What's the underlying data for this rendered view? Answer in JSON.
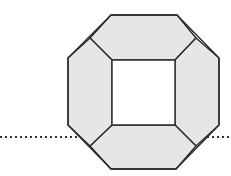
{
  "diagram": {
    "type": "octagonal-frame",
    "colors": {
      "fill": "#e6e6e6",
      "stroke": "#2b2b2b",
      "inner": "#ffffff",
      "dotted": "#333333"
    },
    "outer_octagon": [
      [
        111,
        15
      ],
      [
        177,
        15
      ],
      [
        219,
        58
      ],
      [
        219,
        125
      ],
      [
        176,
        169
      ],
      [
        111,
        169
      ],
      [
        68,
        125
      ],
      [
        68,
        58
      ]
    ],
    "inner_square": [
      [
        112,
        60
      ],
      [
        175,
        60
      ],
      [
        175,
        125
      ],
      [
        112,
        125
      ]
    ],
    "panels": [
      {
        "name": "top-panel",
        "points": [
          [
            111,
            15
          ],
          [
            177,
            15
          ],
          [
            196,
            38
          ],
          [
            175,
            60
          ],
          [
            112,
            60
          ],
          [
            90,
            38
          ]
        ]
      },
      {
        "name": "right-panel",
        "points": [
          [
            196,
            38
          ],
          [
            219,
            58
          ],
          [
            219,
            125
          ],
          [
            196,
            146
          ],
          [
            175,
            125
          ],
          [
            175,
            60
          ]
        ]
      },
      {
        "name": "bottom-panel",
        "points": [
          [
            112,
            125
          ],
          [
            175,
            125
          ],
          [
            196,
            146
          ],
          [
            176,
            169
          ],
          [
            111,
            169
          ],
          [
            90,
            146
          ]
        ]
      },
      {
        "name": "left-panel",
        "points": [
          [
            90,
            38
          ],
          [
            112,
            60
          ],
          [
            112,
            125
          ],
          [
            90,
            146
          ],
          [
            68,
            125
          ],
          [
            68,
            58
          ]
        ]
      }
    ],
    "dotted_line": {
      "y": 137,
      "segments": [
        [
          0,
          79
        ],
        [
          207,
          231
        ]
      ]
    }
  }
}
